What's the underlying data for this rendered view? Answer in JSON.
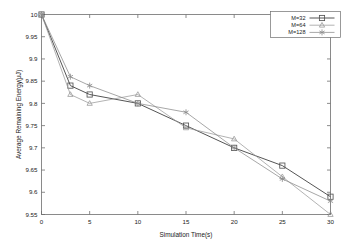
{
  "chart_data": {
    "type": "line",
    "title": "",
    "xlabel": "Simulation Time(s)",
    "ylabel": "Average Remaining Energy(μJ)",
    "xlim": [
      0,
      30
    ],
    "ylim": [
      9.55,
      10.0
    ],
    "xticks": [
      "0",
      "5",
      "10",
      "15",
      "20",
      "25",
      "30"
    ],
    "xtick_values": [
      0,
      5,
      10,
      15,
      20,
      25,
      30
    ],
    "yticks": [
      "9.55",
      "9.6",
      "9.65",
      "9.7",
      "9.75",
      "9.8",
      "9.85",
      "9.9",
      "9.95",
      "10"
    ],
    "ytick_values": [
      9.55,
      9.6,
      9.65,
      9.7,
      9.75,
      9.8,
      9.85,
      9.9,
      9.95,
      10.0
    ],
    "grid": false,
    "legend_position": "top-right",
    "x": [
      0,
      3,
      5,
      10,
      15,
      20,
      25,
      30
    ],
    "series": [
      {
        "name": "M=32",
        "marker": "square",
        "color": "#555555",
        "values": [
          10.0,
          9.84,
          9.82,
          9.8,
          9.75,
          9.7,
          9.66,
          9.59
        ]
      },
      {
        "name": "M=64",
        "marker": "triangle",
        "color": "#9a9a9a",
        "values": [
          10.0,
          9.82,
          9.8,
          9.82,
          9.745,
          9.72,
          9.635,
          9.55
        ]
      },
      {
        "name": "M=128",
        "marker": "star",
        "color": "#8a8a8a",
        "values": [
          10.0,
          9.86,
          9.84,
          9.8,
          9.78,
          9.7,
          9.63,
          9.58
        ]
      }
    ]
  },
  "legend": {
    "entries": [
      {
        "label": "M=32"
      },
      {
        "label": "M=64"
      },
      {
        "label": "M=128"
      }
    ]
  },
  "colors": {
    "axis": "#6e6e6e",
    "text": "#1a1a1a",
    "background": "#ffffff"
  }
}
